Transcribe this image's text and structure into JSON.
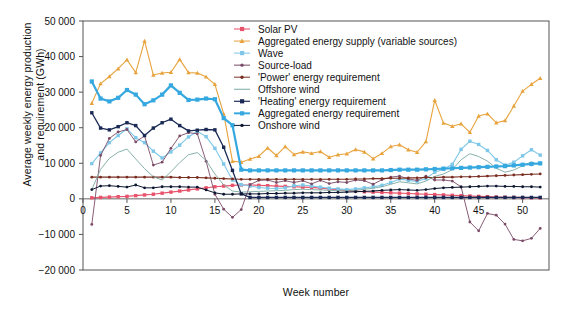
{
  "chart_data": {
    "type": "line",
    "title": "",
    "xlabel": "Week number",
    "ylabel": "Average weekly energy production and requirement (GWh)",
    "ylabel_line1": "Average weekly energy production",
    "ylabel_line2": "and requirement (GWh)",
    "xlim": [
      0,
      53
    ],
    "ylim": [
      -20000,
      50000
    ],
    "grid": false,
    "legend_position": "top-right",
    "yticks": [
      -20000,
      -10000,
      0,
      10000,
      20000,
      30000,
      40000,
      50000
    ],
    "ytick_labels": [
      "−20 000",
      "−10 000",
      "0",
      "10 000",
      "20 000",
      "30 000",
      "40 000",
      "50 000"
    ],
    "xticks": [
      0,
      5,
      10,
      15,
      20,
      25,
      30,
      35,
      40,
      45,
      50
    ],
    "xtick_labels": [
      "0",
      "5",
      "10",
      "15",
      "20",
      "25",
      "30",
      "35",
      "40",
      "45",
      "50"
    ],
    "x": [
      1,
      2,
      3,
      4,
      5,
      6,
      7,
      8,
      9,
      10,
      11,
      12,
      13,
      14,
      15,
      16,
      17,
      18,
      19,
      20,
      21,
      22,
      23,
      24,
      25,
      26,
      27,
      28,
      29,
      30,
      31,
      32,
      33,
      34,
      35,
      36,
      37,
      38,
      39,
      40,
      41,
      42,
      43,
      44,
      45,
      46,
      47,
      48,
      49,
      50,
      51,
      52
    ],
    "series": [
      {
        "name": "Solar PV",
        "color": "#e8536b",
        "marker": "square",
        "linewidth": 1.2,
        "values": [
          300,
          400,
          500,
          600,
          700,
          900,
          1100,
          1300,
          1600,
          1900,
          2200,
          2500,
          2800,
          3100,
          3400,
          3600,
          3800,
          3900,
          3900,
          3800,
          3700,
          3600,
          3500,
          3400,
          3300,
          3200,
          3000,
          2800,
          2600,
          2400,
          2200,
          2000,
          1900,
          1800,
          1700,
          1600,
          1500,
          1400,
          1300,
          1200,
          1100,
          1000,
          900,
          800,
          700,
          600,
          500,
          450,
          400,
          350,
          320,
          300
        ]
      },
      {
        "name": "Aggregated energy supply (variable sources)",
        "color": "#e8a33d",
        "marker": "triangle",
        "linewidth": 1.1,
        "values": [
          26900,
          32400,
          34400,
          36600,
          39100,
          35500,
          44400,
          34800,
          35400,
          35600,
          39200,
          35500,
          35400,
          34300,
          32200,
          23900,
          10600,
          10300,
          11200,
          12000,
          14300,
          12200,
          14700,
          12500,
          13200,
          12800,
          13300,
          11700,
          12400,
          12700,
          13900,
          13200,
          11300,
          12800,
          14700,
          15200,
          13800,
          13100,
          16100,
          27700,
          21300,
          20400,
          21100,
          18700,
          23300,
          23900,
          21400,
          22000,
          26100,
          30300,
          32200,
          33900
        ]
      },
      {
        "name": "Wave",
        "color": "#7fc7e8",
        "marker": "square",
        "linewidth": 1.1,
        "values": [
          9900,
          12900,
          15800,
          17800,
          19700,
          17200,
          15800,
          13400,
          11500,
          13200,
          15100,
          17400,
          19000,
          17500,
          14200,
          9800,
          5300,
          4000,
          3600,
          3200,
          3000,
          2900,
          3100,
          3700,
          3900,
          3600,
          3300,
          3000,
          2800,
          2600,
          2800,
          3100,
          3400,
          3800,
          4600,
          5600,
          5200,
          4900,
          5700,
          7500,
          8300,
          9700,
          13900,
          16200,
          15300,
          13600,
          11000,
          9500,
          10300,
          12100,
          13800,
          12300
        ]
      },
      {
        "name": "Source-load",
        "color": "#7a4a66",
        "marker": "dot",
        "linewidth": 0.9,
        "values": [
          -7200,
          12200,
          17000,
          18800,
          19500,
          16000,
          17700,
          9500,
          10300,
          14200,
          17700,
          18600,
          18300,
          10600,
          1300,
          -2900,
          -5200,
          -3000,
          4000,
          5200,
          5300,
          4600,
          5100,
          4600,
          5100,
          4200,
          5200,
          4300,
          4800,
          4600,
          5300,
          5100,
          4100,
          5400,
          6100,
          6400,
          5600,
          5200,
          6400,
          5300,
          5300,
          5000,
          3400,
          -6500,
          -9000,
          -4100,
          -4600,
          -7100,
          -11400,
          -11800,
          -11100,
          -8300
        ]
      },
      {
        "name": "'Power' energy requirement",
        "color": "#7a2e22",
        "marker": "dot",
        "linewidth": 1.1,
        "values": [
          6100,
          6100,
          6100,
          6100,
          6100,
          6100,
          6100,
          6100,
          6100,
          6100,
          6000,
          6000,
          6000,
          5900,
          5800,
          5700,
          5600,
          5500,
          5500,
          5500,
          5500,
          5500,
          5500,
          5500,
          5500,
          5500,
          5500,
          5500,
          5500,
          5500,
          5600,
          5600,
          5700,
          5700,
          5800,
          5800,
          5900,
          5900,
          6000,
          6000,
          6100,
          6100,
          6200,
          6200,
          6300,
          6400,
          6500,
          6600,
          6700,
          6800,
          6900,
          7000
        ]
      },
      {
        "name": "Offshore wind",
        "color": "#7aa8a0",
        "marker": "none",
        "linewidth": 0.9,
        "values": [
          2600,
          8300,
          11400,
          13100,
          14000,
          11200,
          8500,
          6200,
          5300,
          7600,
          10200,
          12400,
          13000,
          10800,
          7000,
          3900,
          2200,
          1900,
          2000,
          2100,
          2200,
          2300,
          2400,
          2600,
          2700,
          2600,
          2500,
          2400,
          2300,
          2200,
          2400,
          2700,
          3000,
          3400,
          4100,
          4800,
          4500,
          4200,
          5000,
          6300,
          7000,
          8200,
          11000,
          12700,
          11900,
          10600,
          8600,
          7500,
          8100,
          9300,
          10400,
          9500
        ]
      },
      {
        "name": "'Heating' energy requirement",
        "color": "#1b2a55",
        "marker": "square",
        "linewidth": 1.3,
        "values": [
          24200,
          19900,
          19400,
          20300,
          21400,
          20600,
          17800,
          19900,
          21400,
          22400,
          20600,
          19100,
          19300,
          19500,
          19400,
          14500,
          8000,
          1400,
          400,
          400,
          400,
          400,
          400,
          400,
          400,
          400,
          400,
          400,
          400,
          400,
          400,
          400,
          400,
          400,
          400,
          400,
          400,
          400,
          400,
          400,
          400,
          400,
          400,
          400,
          400,
          400,
          400,
          400,
          400,
          400,
          400,
          400
        ]
      },
      {
        "name": "Aggregated energy requirement",
        "color": "#35a8e0",
        "marker": "square",
        "linewidth": 2.2,
        "values": [
          33000,
          28200,
          27400,
          28400,
          30600,
          29300,
          26600,
          27700,
          29300,
          31900,
          29800,
          27800,
          27900,
          28200,
          28000,
          22700,
          20700,
          8200,
          8000,
          8000,
          8000,
          8000,
          8000,
          8000,
          8000,
          8000,
          8000,
          8000,
          8000,
          8000,
          8000,
          8000,
          8000,
          8000,
          8100,
          8200,
          8200,
          8200,
          8300,
          8400,
          8500,
          8600,
          8700,
          8800,
          8900,
          9000,
          9100,
          9200,
          9400,
          9600,
          9800,
          10000
        ]
      },
      {
        "name": "Onshore wind",
        "color": "#0d1730",
        "marker": "dot",
        "linewidth": 1.0,
        "values": [
          2600,
          3600,
          3700,
          3500,
          3300,
          3900,
          3100,
          3100,
          3400,
          3400,
          3400,
          3300,
          3300,
          2500,
          1700,
          1300,
          1300,
          1400,
          1400,
          1400,
          1500,
          1500,
          1600,
          1600,
          1700,
          1700,
          1700,
          1800,
          1800,
          1900,
          2000,
          2100,
          2200,
          2400,
          2500,
          2600,
          2500,
          2400,
          2600,
          2900,
          3100,
          3200,
          3300,
          3400,
          3500,
          3600,
          3600,
          3500,
          3500,
          3400,
          3400,
          3300
        ]
      }
    ]
  }
}
